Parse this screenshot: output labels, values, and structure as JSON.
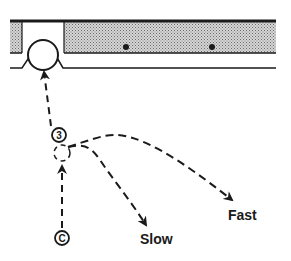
{
  "diagram": {
    "labels": {
      "position_number": "3",
      "start_marker": "C",
      "slow": "Slow",
      "fast": "Fast"
    },
    "colors": {
      "ink": "#1a1a1a",
      "shading": "#9a9a9a",
      "background": "#ffffff"
    }
  }
}
